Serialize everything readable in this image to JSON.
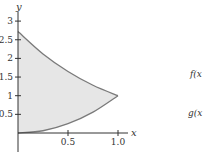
{
  "chart_data": {
    "type": "area",
    "title": "",
    "xlabel": "x",
    "ylabel": "y",
    "xlim": [
      0,
      1.0
    ],
    "ylim": [
      0,
      3
    ],
    "x_ticks": [
      "0.5",
      "1.0"
    ],
    "y_ticks": [
      "0.5",
      "1",
      "1.5",
      "2",
      "2.5",
      "3"
    ],
    "grid": false,
    "series": [
      {
        "name": "f(x)",
        "label": "f(x",
        "x": [
          0,
          0.25,
          0.5,
          0.75,
          1.0
        ],
        "values": [
          2.72,
          2.12,
          1.65,
          1.28,
          1.0
        ]
      },
      {
        "name": "g(x)",
        "label": "g(x",
        "x": [
          0,
          0.25,
          0.5,
          0.75,
          1.0
        ],
        "values": [
          0,
          0.06,
          0.25,
          0.56,
          1.0
        ]
      }
    ],
    "shaded_region": "between f(x) and g(x) for 0 ≤ x ≤ 1",
    "colors": {
      "fill": "#e6e6e6",
      "curve": "#7a7a7a",
      "axis": "#333333"
    }
  }
}
